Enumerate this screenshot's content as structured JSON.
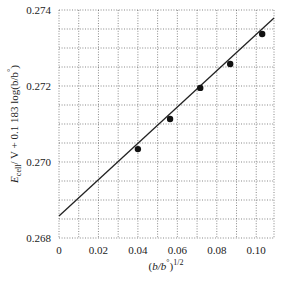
{
  "chart_data": {
    "type": "scatter",
    "title": "",
    "xlabel": "(b/b°)^1/2",
    "xlabel_parts": {
      "base": "(b/b",
      "sup_deg": "°",
      "close": ")",
      "exp": "1/2"
    },
    "ylabel": "E_cell / V + 0.1183 log(b/b°)",
    "ylabel_parts": {
      "E": "E",
      "sub": "cell",
      "rest": "/ V + 0.1 183 log(b/b",
      "deg": "°",
      "close": ")"
    },
    "xlim": [
      0,
      0.109
    ],
    "ylim": [
      0.268,
      0.274
    ],
    "x_ticks": [
      0,
      0.02,
      0.04,
      0.06,
      0.08,
      0.1
    ],
    "x_tick_labels": [
      "0",
      "0.02",
      "0.04",
      "0.06",
      "0.08",
      "0.10"
    ],
    "y_ticks": [
      0.268,
      0.27,
      0.272,
      0.274
    ],
    "y_tick_labels": [
      "0.268",
      "0.270",
      "0.272",
      "0.274"
    ],
    "grid": {
      "on": true,
      "style": "dotted",
      "x_step": 0.01,
      "y_step": 0.0005
    },
    "series": [
      {
        "name": "measured",
        "kind": "points",
        "x": [
          0.04,
          0.0563,
          0.0716,
          0.0868,
          0.103
        ],
        "y": [
          0.27034,
          0.27113,
          0.27195,
          0.27258,
          0.27337
        ]
      },
      {
        "name": "linear fit",
        "kind": "line",
        "x": [
          0,
          0.109
        ],
        "y": [
          0.26858,
          0.27379
        ]
      }
    ],
    "legend": null
  }
}
